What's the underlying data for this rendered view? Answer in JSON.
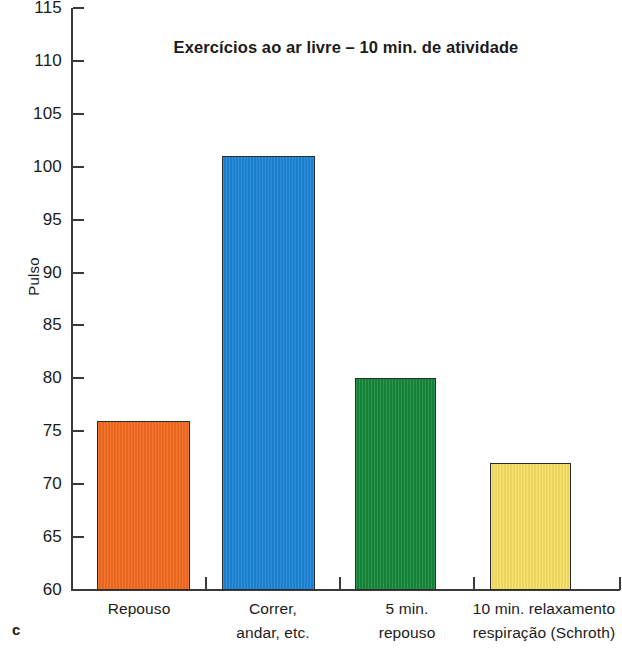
{
  "panel": {
    "letter": "c"
  },
  "chart_data": {
    "type": "bar",
    "title": "Exercícios ao ar livre – 10 min. de atividade",
    "xlabel": "",
    "ylabel": "Pulso",
    "ylim": [
      60,
      115
    ],
    "ytick_step": 5,
    "yticks": [
      115,
      110,
      105,
      100,
      95,
      90,
      85,
      80,
      75,
      70,
      65,
      60
    ],
    "ytick_labels": [
      "115",
      "110",
      "105",
      "100",
      "95",
      "90",
      "85",
      "80",
      "75",
      "70",
      "65",
      "60"
    ],
    "grid": false,
    "legend": "none",
    "categories": [
      "Repouso",
      "Correr, andar, etc.",
      "5 min. repouso",
      "10 min. relaxamento respiração (Schroth)"
    ],
    "category_lines": [
      [
        "Repouso"
      ],
      [
        "Correr,",
        "andar, etc."
      ],
      [
        "5 min.",
        "repouso"
      ],
      [
        "10 min. relaxamento",
        "respiração (Schroth)"
      ]
    ],
    "values": [
      76,
      101,
      80,
      72
    ],
    "colors": [
      "#F26A1E",
      "#1B85D6",
      "#16883B",
      "#F6DF63"
    ],
    "bar_edge_color": "#2b2b2b"
  }
}
